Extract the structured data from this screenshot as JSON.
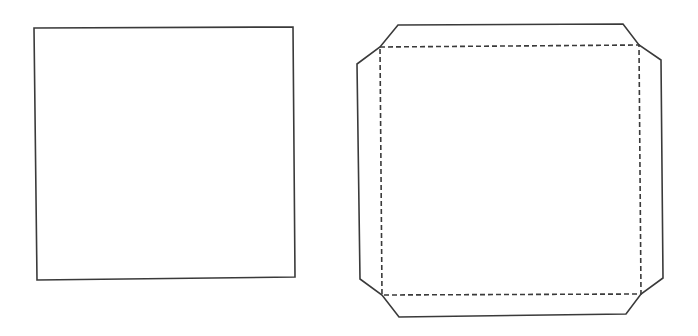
{
  "diagram": {
    "stroke_color": "#3a3a3a",
    "background": "#ffffff",
    "stroke_width": 1.6,
    "dash_pattern": "5,3",
    "shapes": [
      {
        "id": "flat-square",
        "type": "polygon",
        "line_style": "solid",
        "points": "34,28 293,27 295,277 37,280"
      },
      {
        "id": "box-net-outline",
        "type": "polygon",
        "line_style": "solid",
        "points": "398,25 623,24 639,45 661,60 663,278 641,294 626,314 399,317 382,295 360,279 357,64 380,47"
      },
      {
        "id": "fold-lines",
        "type": "polygon",
        "line_style": "dashed",
        "points": "380,47 639,45 641,294 382,295"
      }
    ]
  }
}
